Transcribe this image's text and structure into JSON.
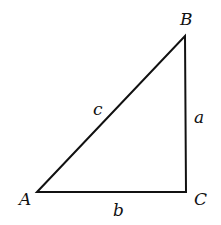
{
  "diagram": {
    "type": "right-triangle",
    "vertices": {
      "A": {
        "label": "A",
        "x": 37,
        "y": 192
      },
      "B": {
        "label": "B",
        "x": 185,
        "y": 36
      },
      "C": {
        "label": "C",
        "x": 186,
        "y": 192
      }
    },
    "sides": {
      "a": {
        "label": "a",
        "between": [
          "B",
          "C"
        ]
      },
      "b": {
        "label": "b",
        "between": [
          "A",
          "C"
        ]
      },
      "c": {
        "label": "c",
        "between": [
          "A",
          "B"
        ]
      }
    },
    "stroke_color": "#111111"
  }
}
